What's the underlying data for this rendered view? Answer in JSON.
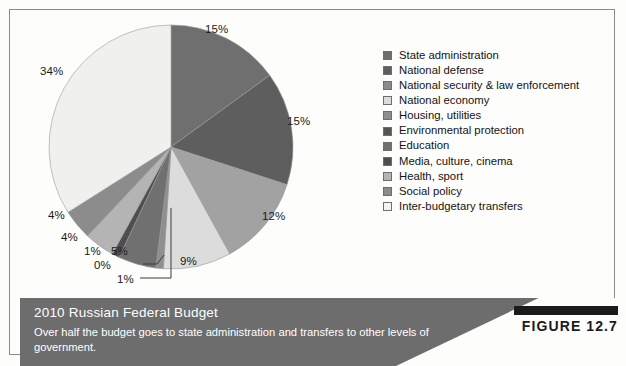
{
  "figure": {
    "badge_label": "FIGURE 12.7",
    "caption_title": "2010 Russian Federal Budget",
    "caption_description": "Over half the budget goes to state administration and transfers to other levels of government."
  },
  "colors": {
    "frame_border": "#8a8a8a",
    "caption_bar": "#6d6d6d",
    "caption_text": "#ffffff",
    "badge_bar": "#1b1b1b",
    "page_background": "#fdfdfb"
  },
  "chart_data": {
    "type": "pie",
    "title": "2010 Russian Federal Budget",
    "xlabel": "",
    "ylabel": "",
    "legend_position": "right",
    "grid": false,
    "units": "percent of federal budget",
    "categories": [
      "State administration",
      "National defense",
      "National security & law enforcement",
      "National economy",
      "Housing, utilities",
      "Environmental protection",
      "Education",
      "Media, culture, cinema",
      "Health, sport",
      "Social policy",
      "Inter-budgetary transfers"
    ],
    "values": [
      15,
      15,
      12,
      9,
      1,
      0,
      5,
      1,
      4,
      4,
      34
    ],
    "value_labels": [
      "15%",
      "15%",
      "12%",
      "9%",
      "1%",
      "0%",
      "5%",
      "1%",
      "4%",
      "4%",
      "34%"
    ],
    "slice_colors": [
      "#6f6f6f",
      "#5e5e5e",
      "#a2a2a2",
      "#dcdcdc",
      "#8f8f8f",
      "#3f3f3f",
      "#707070",
      "#4e4e4e",
      "#b4b4b4",
      "#8c8c8c",
      "#f0f0ee"
    ]
  },
  "legend": {
    "items": [
      {
        "label": "State administration",
        "color": "#6f6f6f"
      },
      {
        "label": "National defense",
        "color": "#5e5e5e"
      },
      {
        "label": "National security & law enforcement",
        "color": "#8b8b8b"
      },
      {
        "label": "National economy",
        "color": "#dcdcdc"
      },
      {
        "label": "Housing, utilities",
        "color": "#8f8f8f"
      },
      {
        "label": "Environmental protection",
        "color": "#555555"
      },
      {
        "label": "Education",
        "color": "#707070"
      },
      {
        "label": "Media, culture, cinema",
        "color": "#4e4e4e"
      },
      {
        "label": "Health, sport",
        "color": "#b4b4b4"
      },
      {
        "label": "Social policy",
        "color": "#8c8c8c"
      },
      {
        "label": "Inter-budgetary transfers",
        "color": "#f4f4f2"
      }
    ]
  },
  "pie_labels": [
    {
      "text": "15%",
      "x": 165,
      "y": 0
    },
    {
      "text": "15%",
      "x": 247,
      "y": 92
    },
    {
      "text": "12%",
      "x": 222,
      "y": 187
    },
    {
      "text": "9%",
      "x": 140,
      "y": 232
    },
    {
      "text": "5%",
      "x": 71,
      "y": 222
    },
    {
      "text": "0%",
      "x": 54,
      "y": 236
    },
    {
      "text": "1%",
      "x": 77,
      "y": 250
    },
    {
      "text": "1%",
      "x": 44,
      "y": 222
    },
    {
      "text": "4%",
      "x": 21,
      "y": 208
    },
    {
      "text": "4%",
      "x": 8,
      "y": 186
    },
    {
      "text": "34%",
      "x": 0,
      "y": 42
    }
  ]
}
